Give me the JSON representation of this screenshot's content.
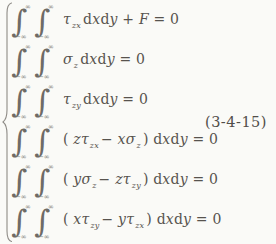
{
  "colors": {
    "ink": "#57534e",
    "background": "#fafaf7",
    "brace": "#8e8b86"
  },
  "math": {
    "integral_sign": "∫",
    "upper_limit": "∞",
    "lower_limit": "−∞"
  },
  "equation": {
    "number": "(3-4-15)"
  },
  "rows": [
    {
      "tokens": [
        {
          "k": "v",
          "s": "τ",
          "sub": "zx",
          "n": "tau-zx"
        },
        {
          "k": "r",
          "s": "d",
          "n": "differential-d"
        },
        {
          "k": "v",
          "s": "x",
          "n": "var-x"
        },
        {
          "k": "r",
          "s": "d",
          "n": "differential-d"
        },
        {
          "k": "v",
          "s": "y",
          "n": "var-y"
        },
        {
          "k": "r",
          "s": " + ",
          "n": "plus-operator"
        },
        {
          "k": "v",
          "s": "F",
          "n": "var-F"
        },
        {
          "k": "r",
          "s": " = 0",
          "n": "equals-zero"
        }
      ]
    },
    {
      "tokens": [
        {
          "k": "v",
          "s": "σ",
          "sub": "z",
          "n": "sigma-z"
        },
        {
          "k": "r",
          "s": "d",
          "n": "differential-d"
        },
        {
          "k": "v",
          "s": "x",
          "n": "var-x"
        },
        {
          "k": "r",
          "s": "d",
          "n": "differential-d"
        },
        {
          "k": "v",
          "s": "y",
          "n": "var-y"
        },
        {
          "k": "r",
          "s": " = 0",
          "n": "equals-zero"
        }
      ]
    },
    {
      "tokens": [
        {
          "k": "v",
          "s": "τ",
          "sub": "zy",
          "n": "tau-zy"
        },
        {
          "k": "r",
          "s": "d",
          "n": "differential-d"
        },
        {
          "k": "v",
          "s": "x",
          "n": "var-x"
        },
        {
          "k": "r",
          "s": "d",
          "n": "differential-d"
        },
        {
          "k": "v",
          "s": "y",
          "n": "var-y"
        },
        {
          "k": "r",
          "s": " = 0",
          "n": "equals-zero"
        }
      ]
    },
    {
      "tokens": [
        {
          "k": "r",
          "s": "( ",
          "n": "open-paren"
        },
        {
          "k": "v",
          "s": "z",
          "n": "var-z"
        },
        {
          "k": "v",
          "s": "τ",
          "sub": "zx",
          "n": "tau-zx"
        },
        {
          "k": "r",
          "s": "− ",
          "n": "minus-operator"
        },
        {
          "k": "v",
          "s": "x",
          "n": "var-x"
        },
        {
          "k": "v",
          "s": "σ",
          "sub": "z",
          "n": "sigma-z"
        },
        {
          "k": "r",
          "s": ") ",
          "n": "close-paren"
        },
        {
          "k": "r",
          "s": "d",
          "n": "differential-d"
        },
        {
          "k": "v",
          "s": "x",
          "n": "var-x"
        },
        {
          "k": "r",
          "s": "d",
          "n": "differential-d"
        },
        {
          "k": "v",
          "s": "y",
          "n": "var-y"
        },
        {
          "k": "r",
          "s": " = 0",
          "n": "equals-zero"
        }
      ]
    },
    {
      "tokens": [
        {
          "k": "r",
          "s": "( ",
          "n": "open-paren"
        },
        {
          "k": "v",
          "s": "y",
          "n": "var-y"
        },
        {
          "k": "v",
          "s": "σ",
          "sub": "z",
          "n": "sigma-z"
        },
        {
          "k": "r",
          "s": "− ",
          "n": "minus-operator"
        },
        {
          "k": "v",
          "s": "z",
          "n": "var-z"
        },
        {
          "k": "v",
          "s": "τ",
          "sub": "zy",
          "n": "tau-zy"
        },
        {
          "k": "r",
          "s": ") ",
          "n": "close-paren"
        },
        {
          "k": "r",
          "s": "d",
          "n": "differential-d"
        },
        {
          "k": "v",
          "s": "x",
          "n": "var-x"
        },
        {
          "k": "r",
          "s": "d",
          "n": "differential-d"
        },
        {
          "k": "v",
          "s": "y",
          "n": "var-y"
        },
        {
          "k": "r",
          "s": " = 0",
          "n": "equals-zero"
        }
      ]
    },
    {
      "tokens": [
        {
          "k": "r",
          "s": "( ",
          "n": "open-paren"
        },
        {
          "k": "v",
          "s": "x",
          "n": "var-x"
        },
        {
          "k": "v",
          "s": "τ",
          "sub": "zy",
          "n": "tau-zy"
        },
        {
          "k": "r",
          "s": "− ",
          "n": "minus-operator"
        },
        {
          "k": "v",
          "s": "y",
          "n": "var-y"
        },
        {
          "k": "v",
          "s": "τ",
          "sub": "zx",
          "n": "tau-zx"
        },
        {
          "k": "r",
          "s": ") ",
          "n": "close-paren"
        },
        {
          "k": "r",
          "s": "d",
          "n": "differential-d"
        },
        {
          "k": "v",
          "s": "x",
          "n": "var-x"
        },
        {
          "k": "r",
          "s": "d",
          "n": "differential-d"
        },
        {
          "k": "v",
          "s": "y",
          "n": "var-y"
        },
        {
          "k": "r",
          "s": " = 0",
          "n": "equals-zero"
        }
      ]
    }
  ]
}
